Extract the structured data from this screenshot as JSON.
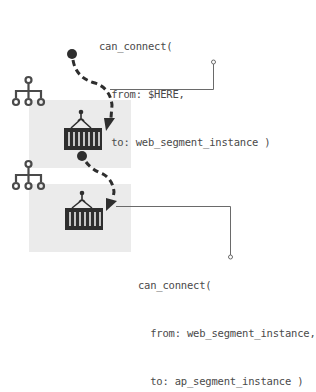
{
  "diagram": {
    "segments": [
      {
        "id": "web_segment",
        "icon": "network-hierarchy-icon",
        "container_icon": "shipping-container-icon",
        "box_color": "#ebebeb"
      },
      {
        "id": "ap_segment",
        "icon": "network-hierarchy-icon",
        "container_icon": "shipping-container-icon",
        "box_color": "#ebebeb"
      }
    ],
    "annotations": [
      {
        "lines": [
          "can_connect(",
          "  from: $HERE,",
          "  to: web_segment_instance )"
        ]
      },
      {
        "lines": [
          "can_connect(",
          "  from: web_segment_instance,",
          "  to: ap_segment_instance )"
        ]
      }
    ],
    "colors": {
      "ink": "#2e2e2e",
      "text": "#4a4a4a",
      "leader_line": "#6a6a6a",
      "box": "#ebebeb"
    }
  }
}
